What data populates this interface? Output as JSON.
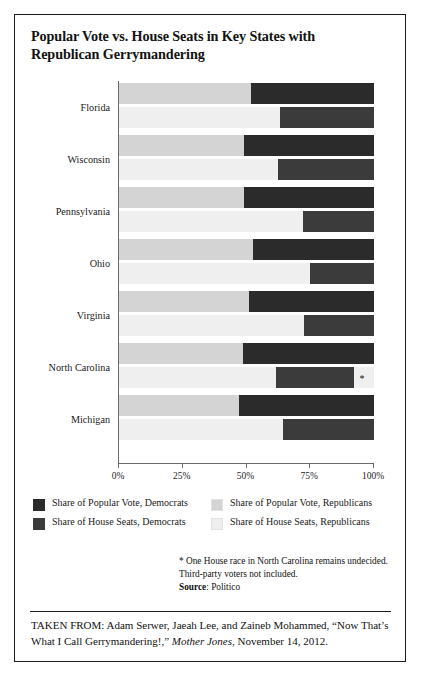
{
  "title": "Popular Vote vs. House Seats in Key States with Republican Gerrymandering",
  "colors": {
    "popular_vote_democrats": "#2b2b2b",
    "house_seats_democrats": "#3b3b3b",
    "popular_vote_republicans": "#d4d4d4",
    "house_seats_republicans": "#efefef",
    "axis": "#6a6a6a",
    "frame": "#1b1b1b",
    "text": "#121212"
  },
  "legend": {
    "items": [
      {
        "label": "Share of Popular Vote, Democrats",
        "swatch": "#2b2b2b",
        "column": "left",
        "row": 0
      },
      {
        "label": "Share of House Seats, Democrats",
        "swatch": "#3b3b3b",
        "column": "left",
        "row": 1
      },
      {
        "label": "Share of Popular Vote, Republicans",
        "swatch": "#d4d4d4",
        "column": "right",
        "row": 0
      },
      {
        "label": "Share of House Seats, Republicans",
        "swatch": "#efefef",
        "column": "right",
        "row": 1
      }
    ]
  },
  "footnotes": {
    "line1": "* One House race in North Carolina remains undecided.",
    "line2": "Third-party voters not included.",
    "source_label": "Source",
    "source_sep": ": ",
    "source_value": "Politico"
  },
  "taken_from": {
    "prefix": "TAKEN FROM: Adam Serwer, Jaeah Lee, and Zaineb Mohammed,",
    "article": "“Now That’s What I Call Gerrymandering!,”",
    "publication": "Mother Jones",
    "comma": ",",
    "date": "November 14, 2012."
  },
  "chart_data": {
    "type": "bar",
    "orientation": "horizontal",
    "stacked": true,
    "title": "Popular Vote vs. House Seats in Key States with Republican Gerrymandering",
    "xlabel": "",
    "ylabel": "",
    "xlim": [
      0,
      100
    ],
    "xticks": [
      0,
      25,
      50,
      75,
      100
    ],
    "xticklabels": [
      "0%",
      "25%",
      "50%",
      "75%",
      "100%"
    ],
    "grid": false,
    "legend_position": "below-plot",
    "categories": [
      "Florida",
      "Wisconsin",
      "Pennsylvania",
      "Ohio",
      "Virginia",
      "North Carolina",
      "Michigan"
    ],
    "series": [
      {
        "name": "Share of Popular Vote, Democrats",
        "color": "#2b2b2b",
        "values": [
          48.4,
          51.1,
          51.1,
          47.4,
          49.2,
          51.5,
          53.1
        ]
      },
      {
        "name": "Share of Popular Vote, Republicans",
        "color": "#d4d4d4",
        "values": [
          51.6,
          48.9,
          48.9,
          52.6,
          50.8,
          48.5,
          46.9
        ]
      },
      {
        "name": "Share of House Seats, Democrats",
        "color": "#3b3b3b",
        "values": [
          37.0,
          37.5,
          27.8,
          25.0,
          27.3,
          30.8,
          35.7
        ]
      },
      {
        "name": "Share of House Seats, Republicans",
        "color": "#efefef",
        "values": [
          63.0,
          62.5,
          72.2,
          75.0,
          72.7,
          61.5,
          64.3
        ]
      }
    ],
    "annotations": [
      {
        "text": "*",
        "category": "North Carolina",
        "series": "Share of House Seats, Republicans",
        "note": "One House race in North Carolina remains undecided.",
        "x": 95.5
      }
    ],
    "rows": [
      {
        "state": "Florida",
        "popular_vote": {
          "republicans": 51.6,
          "democrats": 48.4
        },
        "house_seats": {
          "republicans": 63.0,
          "democrats": 37.0
        }
      },
      {
        "state": "Wisconsin",
        "popular_vote": {
          "republicans": 48.9,
          "democrats": 51.1
        },
        "house_seats": {
          "republicans": 62.5,
          "democrats": 37.5
        }
      },
      {
        "state": "Pennsylvania",
        "popular_vote": {
          "republicans": 48.9,
          "democrats": 51.1
        },
        "house_seats": {
          "republicans": 72.2,
          "democrats": 27.8
        }
      },
      {
        "state": "Ohio",
        "popular_vote": {
          "republicans": 52.6,
          "democrats": 47.4
        },
        "house_seats": {
          "republicans": 75.0,
          "democrats": 25.0
        }
      },
      {
        "state": "Virginia",
        "popular_vote": {
          "republicans": 50.8,
          "democrats": 49.2
        },
        "house_seats": {
          "republicans": 72.7,
          "democrats": 27.3
        }
      },
      {
        "state": "North Carolina",
        "popular_vote": {
          "republicans": 48.5,
          "democrats": 51.5
        },
        "house_seats": {
          "republicans": 61.5,
          "democrats": 30.8,
          "undecided": 7.7
        }
      },
      {
        "state": "Michigan",
        "popular_vote": {
          "republicans": 46.9,
          "democrats": 53.1
        },
        "house_seats": {
          "republicans": 64.3,
          "democrats": 35.7
        }
      }
    ]
  }
}
